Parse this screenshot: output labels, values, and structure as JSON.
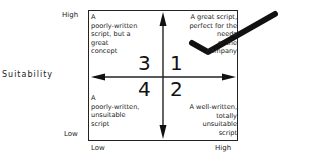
{
  "y_axis": {
    "title": "Suitability",
    "high": "High",
    "low": "Low"
  },
  "x_axis": {
    "low": "Low",
    "high": "High"
  },
  "quadrants": [
    {
      "number": "1",
      "text_lines": [
        "A great script,",
        "perfect for the",
        "needs",
        "of the",
        "company"
      ]
    },
    {
      "number": "2",
      "text_lines": [
        "A well-written,",
        "totally",
        "unsuitable",
        "script"
      ]
    },
    {
      "number": "3",
      "text_lines": [
        "A",
        "poorly-written",
        "script, but a",
        "great",
        "concept"
      ]
    },
    {
      "number": "4",
      "text_lines": [
        "A",
        "poorly-written,",
        "unsuitable",
        "script"
      ]
    }
  ],
  "annotation": {
    "type": "checkmark",
    "color": "#111111"
  }
}
